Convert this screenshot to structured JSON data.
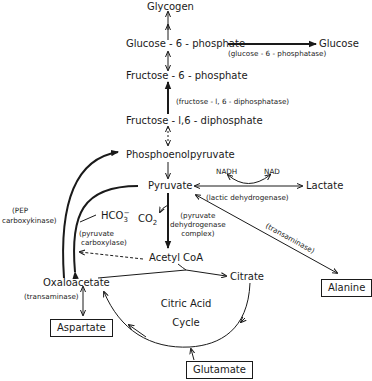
{
  "diagram": {
    "nodes": {
      "glycogen": "Glycogen",
      "g6p": "Glucose - 6 - phosphate",
      "glucose": "Glucose",
      "f6p": "Fructose - 6 - phosphate",
      "fdp": "Fructose - l,6 - diphosphate",
      "pep": "Phosphoenolpyruvate",
      "pyruvate": "Pyruvate",
      "lactate": "Lactate",
      "nadh": "NADH",
      "nad": "NAD",
      "hco3": "HCO",
      "hco3_sub": "3",
      "hco3_sup": "−",
      "co2": "CO",
      "co2_sub": "2",
      "acetyl_coa": "Acetyl CoA",
      "oxaloacetate": "Oxaloacetate",
      "citrate": "Citrate",
      "cycle_line1": "Citric Acid",
      "cycle_line2": "Cycle",
      "alanine": "Alanine",
      "aspartate": "Aspartate",
      "glutamate": "Glutamate"
    },
    "enzymes": {
      "g6pase": "(glucose - 6 - phosphatase)",
      "fdpase": "(fructose - l, 6 - diphosphatase)",
      "pepck_line1": "(PEP",
      "pepck_line2": "carboxykinase)",
      "pc_line1": "(pyruvate",
      "pc_line2": "carboxylase)",
      "pdh_line1": "(pyruvate",
      "pdh_line2": "dehydrogenase",
      "pdh_line3": "complex)",
      "ldh": "(lactic dehydrogenase)",
      "transaminase_alanine": "(transaminase)",
      "transaminase_aspartate": "(transaminase)"
    }
  }
}
